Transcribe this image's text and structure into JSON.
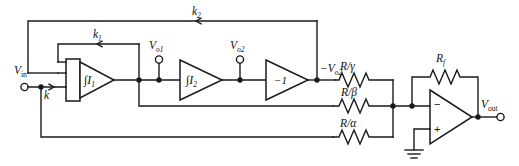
{
  "diagram": {
    "type": "circuit-schematic"
  },
  "terminals": {
    "input": {
      "label": "V",
      "sub": "in",
      "name": "Vin"
    },
    "output": {
      "label": "V",
      "sub": "out",
      "name": "Vout"
    },
    "probe1": {
      "label": "V",
      "sub": "o1",
      "name": "Vo1"
    },
    "probe2": {
      "label": "V",
      "sub": "o2",
      "name": "Vo2"
    },
    "inverted_out": {
      "prefix": "−",
      "label": "V",
      "sub": "o2",
      "name": "-Vo2"
    }
  },
  "blocks": {
    "integrator1": {
      "label": "∫I",
      "sub": "1",
      "name": "integrator-1"
    },
    "integrator2": {
      "label": "∫I",
      "sub": "2",
      "name": "integrator-2"
    },
    "inverter": {
      "label": "−1",
      "name": "unity-inverter"
    },
    "opamp": {
      "minus": "−",
      "plus": "+",
      "name": "summing-opamp"
    }
  },
  "gains": {
    "k": "k",
    "k1": {
      "label": "k",
      "sub": "1"
    },
    "k2": {
      "label": "k",
      "sub": "2"
    }
  },
  "resistors": [
    {
      "name": "resistor-r-gamma",
      "num": "R",
      "den": "γ",
      "label": "R/γ"
    },
    {
      "name": "resistor-r-beta",
      "num": "R",
      "den": "β",
      "label": "R/β"
    },
    {
      "name": "resistor-r-alpha",
      "num": "R",
      "den": "α",
      "label": "R/α"
    },
    {
      "name": "resistor-rf",
      "num": "R",
      "den": "f",
      "label": "R_f"
    }
  ],
  "feedback_label": {
    "label": "R",
    "sub": "f"
  },
  "colors": {
    "line": "#1a1a1a",
    "background": "#ffffff",
    "fill": "#ffffff"
  }
}
